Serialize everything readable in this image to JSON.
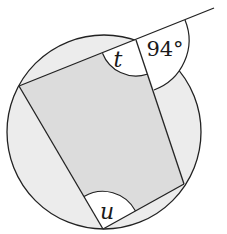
{
  "diagram": {
    "type": "cyclic-quadrilateral-with-exterior-angle",
    "labels": {
      "angle_t": "t",
      "angle_u": "u",
      "exterior_angle": "94°"
    },
    "colors": {
      "stroke": "#222222",
      "circle_fill": "#ececec",
      "quad_fill": "#dcdcdc",
      "angle_sector_fill": "#ffffff"
    },
    "circle": {
      "cx": 104,
      "cy": 132,
      "r": 97
    },
    "vertices": {
      "top": [
        136,
        40
      ],
      "left": [
        19,
        86
      ],
      "bottom": [
        103,
        229
      ],
      "right": [
        184,
        184
      ]
    },
    "extended_line_end": [
      214,
      8
    ]
  }
}
